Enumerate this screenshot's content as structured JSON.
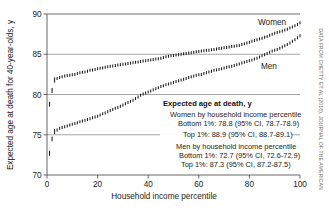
{
  "credit": "DATA FROM CHETTY ET AL (2016), JOURNAL OF THE AMERICAN",
  "series_labels": {
    "women": "Women",
    "men": "Men"
  },
  "legend": {
    "title": "Expected age at death, y",
    "women_heading": "Women by household income percentile",
    "women_bottom": "Bottom 1%: 78.8 (95% CI, 78.7-78.9)",
    "women_top": "Top 1%: 88.9 (95% CI, 88.7-89.1)",
    "men_heading": "Men by household income percentile",
    "men_bottom": "Bottom 1%: 72.7 (95% CI, 72.6-72.9)",
    "men_top": "Top 1%: 87.3 (95% CI, 87.2-87.5)"
  },
  "chart_data": {
    "type": "scatter",
    "title": "",
    "xlabel": "Household income percentile",
    "ylabel": "Expected age at death for 40-year-olds, y",
    "xlim": [
      0,
      100
    ],
    "ylim": [
      70,
      90
    ],
    "xticks": [
      0,
      20,
      40,
      60,
      80,
      100
    ],
    "yticks": [
      70,
      75,
      80,
      85,
      90
    ],
    "grid": "horizontal",
    "legend_position": "inside-center-right",
    "marker": "vertical-dash-confidence-interval",
    "x": [
      1,
      2,
      3,
      4,
      5,
      6,
      7,
      8,
      9,
      10,
      11,
      12,
      13,
      14,
      15,
      16,
      17,
      18,
      19,
      20,
      21,
      22,
      23,
      24,
      25,
      26,
      27,
      28,
      29,
      30,
      31,
      32,
      33,
      34,
      35,
      36,
      37,
      38,
      39,
      40,
      41,
      42,
      43,
      44,
      45,
      46,
      47,
      48,
      49,
      50,
      51,
      52,
      53,
      54,
      55,
      56,
      57,
      58,
      59,
      60,
      61,
      62,
      63,
      64,
      65,
      66,
      67,
      68,
      69,
      70,
      71,
      72,
      73,
      74,
      75,
      76,
      77,
      78,
      79,
      80,
      81,
      82,
      83,
      84,
      85,
      86,
      87,
      88,
      89,
      90,
      91,
      92,
      93,
      94,
      95,
      96,
      97,
      98,
      99,
      100
    ],
    "series": [
      {
        "name": "Women",
        "color": "#1a1a1a",
        "values": [
          78.8,
          80.5,
          81.8,
          82.0,
          82.1,
          82.2,
          82.3,
          82.35,
          82.4,
          82.45,
          82.5,
          82.6,
          82.7,
          82.75,
          82.8,
          82.9,
          83.0,
          83.05,
          83.1,
          83.2,
          83.25,
          83.3,
          83.4,
          83.45,
          83.5,
          83.55,
          83.6,
          83.65,
          83.7,
          83.75,
          83.8,
          83.85,
          83.9,
          83.95,
          84.0,
          84.05,
          84.1,
          84.15,
          84.2,
          84.25,
          84.3,
          84.35,
          84.4,
          84.45,
          84.5,
          84.6,
          84.7,
          84.75,
          84.8,
          84.85,
          84.9,
          84.95,
          85.0,
          85.05,
          85.1,
          85.15,
          85.2,
          85.25,
          85.3,
          85.35,
          85.4,
          85.45,
          85.5,
          85.5,
          85.55,
          85.6,
          85.65,
          85.7,
          85.75,
          85.8,
          85.85,
          85.9,
          85.95,
          86.0,
          86.05,
          86.1,
          86.2,
          86.3,
          86.4,
          86.5,
          86.6,
          86.7,
          86.8,
          86.9,
          87.0,
          87.1,
          87.2,
          87.35,
          87.5,
          87.6,
          87.7,
          87.8,
          87.9,
          88.0,
          88.1,
          88.25,
          88.4,
          88.55,
          88.7,
          88.9
        ]
      },
      {
        "name": "Men",
        "color": "#1a1a1a",
        "values": [
          72.7,
          74.5,
          75.4,
          75.6,
          75.8,
          75.9,
          76.0,
          76.1,
          76.2,
          76.3,
          76.4,
          76.5,
          76.6,
          76.7,
          76.8,
          76.9,
          77.0,
          77.1,
          77.2,
          77.3,
          77.45,
          77.6,
          77.7,
          77.85,
          78.0,
          78.15,
          78.3,
          78.4,
          78.55,
          78.7,
          78.85,
          79.0,
          79.15,
          79.3,
          79.5,
          79.7,
          79.9,
          80.05,
          80.2,
          80.3,
          80.45,
          80.6,
          80.7,
          80.85,
          81.0,
          81.1,
          81.2,
          81.3,
          81.4,
          81.5,
          81.6,
          81.7,
          81.8,
          81.9,
          82.0,
          82.1,
          82.2,
          82.3,
          82.4,
          82.45,
          82.5,
          82.6,
          82.7,
          82.8,
          82.9,
          83.0,
          83.05,
          83.1,
          83.2,
          83.3,
          83.4,
          83.45,
          83.5,
          83.6,
          83.7,
          83.8,
          83.9,
          84.0,
          84.1,
          84.2,
          84.3,
          84.4,
          84.5,
          84.65,
          84.8,
          84.95,
          85.1,
          85.25,
          85.4,
          85.5,
          85.6,
          85.75,
          85.9,
          86.05,
          86.2,
          86.4,
          86.6,
          86.8,
          87.05,
          87.3
        ]
      }
    ]
  }
}
